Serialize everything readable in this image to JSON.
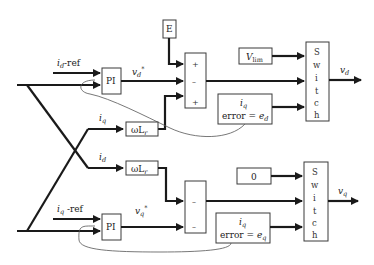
{
  "diagram": {
    "type": "control-block-diagram",
    "top_branch": {
      "input_label_main": "i",
      "input_label_sub": "d",
      "input_label_suffix": "-ref",
      "pi_label": "PI",
      "pi_output_main": "v",
      "pi_output_sub": "d",
      "pi_output_sup": "*",
      "const_block": "E",
      "sum_signs": [
        "+",
        "–",
        "+"
      ],
      "limit_main": "V",
      "limit_sub": "lim",
      "error_line1_main": "i",
      "error_line1_sub": "q",
      "error_line2_prefix": "error = ",
      "error_line2_main": "e",
      "error_line2_sub": "d",
      "switch_letters": [
        "S",
        "w",
        "i",
        "t",
        "c",
        "h"
      ],
      "output_main": "v",
      "output_sub": "d"
    },
    "cross_coupling": {
      "upper_label_main": "i",
      "upper_label_sub": "q",
      "upper_gain_main": "ωL",
      "upper_gain_sub": "r",
      "lower_label_main": "i",
      "lower_label_sub": "d",
      "lower_gain_main": "ωL",
      "lower_gain_sub": "r"
    },
    "bottom_branch": {
      "input_label_main": "i",
      "input_label_sub": "q",
      "input_label_suffix": " -ref",
      "pi_label": "PI",
      "pi_output_main": "v",
      "pi_output_sub": "q",
      "pi_output_sup": "*",
      "sum_signs": [
        "–",
        "–"
      ],
      "zero_block": "0",
      "error_line1_main": "i",
      "error_line1_sub": "q",
      "error_line2_prefix": "error = ",
      "error_line2_main": "e",
      "error_line2_sub": "q",
      "switch_letters": [
        "S",
        "w",
        "i",
        "t",
        "c",
        "h"
      ],
      "output_main": "v",
      "output_sub": "q"
    }
  }
}
